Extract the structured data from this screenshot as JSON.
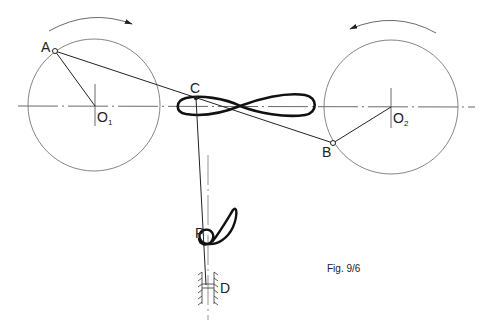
{
  "figure": {
    "caption": "Fig. 9/6",
    "labels": {
      "A": "A",
      "B": "B",
      "C": "C",
      "P": "P",
      "D": "D",
      "O1_main": "O",
      "O1_sub": "1",
      "O2_main": "O",
      "O2_sub": "2"
    },
    "elements": [
      {
        "name": "crank-circle-1",
        "center": "O1",
        "rotation": "clockwise"
      },
      {
        "name": "crank-circle-2",
        "center": "O2",
        "rotation": "counterclockwise"
      },
      {
        "name": "coupler-line",
        "from": "A",
        "to": "B",
        "through": "C"
      },
      {
        "name": "figure-eight-coupler-curve",
        "point": "C"
      },
      {
        "name": "connecting-rod",
        "from": "C",
        "to": "D"
      },
      {
        "name": "coupler-curve-P",
        "point": "P"
      },
      {
        "name": "slider-guide",
        "point": "D"
      }
    ],
    "colors": {
      "ink": "#222222",
      "thin": "#555555",
      "background": "#ffffff"
    }
  }
}
